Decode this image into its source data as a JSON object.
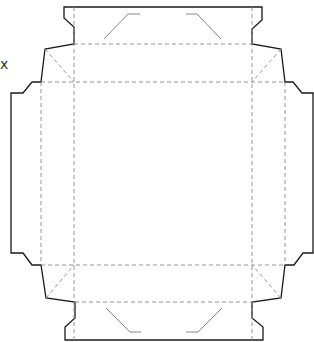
{
  "diagram": {
    "type": "box-dieline",
    "edge_mark": "x",
    "colors": {
      "cut_line": "#1a1a1a",
      "fold_line": "#8a8a8a",
      "glue_line": "#7a7a7a",
      "background": "#ffffff"
    },
    "legend": {
      "cut_line": "solid",
      "fold_line": "dashed"
    },
    "panels": [
      {
        "name": "base",
        "x": 74,
        "y": 82,
        "w": 178,
        "h": 183
      },
      {
        "name": "top-wall",
        "x": 74,
        "y": 44,
        "w": 178,
        "h": 38
      },
      {
        "name": "bottom-wall",
        "x": 74,
        "y": 265,
        "w": 178,
        "h": 37
      },
      {
        "name": "left-wall",
        "x": 41,
        "y": 82,
        "w": 33,
        "h": 183
      },
      {
        "name": "right-wall",
        "x": 252,
        "y": 82,
        "w": 33,
        "h": 183
      },
      {
        "name": "top-tuck-flap",
        "x": 64,
        "y": 7,
        "w": 198,
        "h": 37
      },
      {
        "name": "bottom-tuck-flap",
        "x": 65,
        "y": 302,
        "w": 198,
        "h": 38
      },
      {
        "name": "left-tuck-flap",
        "x": 11,
        "y": 93,
        "w": 30,
        "h": 160
      },
      {
        "name": "right-tuck-flap",
        "x": 285,
        "y": 93,
        "w": 29,
        "h": 160
      }
    ]
  }
}
